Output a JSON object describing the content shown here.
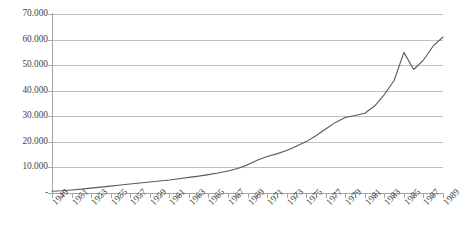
{
  "chart_data": {
    "type": "line",
    "title": "",
    "subtitle": "",
    "xlabel": "",
    "ylabel": "",
    "xlim": [
      1949,
      1989
    ],
    "ylim": [
      0,
      70000
    ],
    "grid": true,
    "legend": false,
    "legend_position": "none",
    "y_tick_labels": [
      "70.000",
      "60.000",
      "50.000",
      "40.000",
      "30.000",
      "20.000",
      "10.000",
      "-"
    ],
    "y_tick_values": [
      70000,
      60000,
      50000,
      40000,
      30000,
      20000,
      10000,
      0
    ],
    "x_tick_labels": [
      "1949",
      "1951",
      "1953",
      "1955",
      "1957",
      "1959",
      "1961",
      "1963",
      "1965",
      "1967",
      "1969",
      "1971",
      "1973",
      "1975",
      "1977",
      "1979",
      "1981",
      "1983",
      "1985",
      "1987",
      "1989"
    ],
    "x_tick_values": [
      1949,
      1951,
      1953,
      1955,
      1957,
      1959,
      1961,
      1963,
      1965,
      1967,
      1969,
      1971,
      1973,
      1975,
      1977,
      1979,
      1981,
      1983,
      1985,
      1987,
      1989
    ],
    "x": [
      1949,
      1950,
      1951,
      1952,
      1953,
      1954,
      1955,
      1956,
      1957,
      1958,
      1959,
      1960,
      1961,
      1962,
      1963,
      1964,
      1965,
      1966,
      1967,
      1968,
      1969,
      1970,
      1971,
      1972,
      1973,
      1974,
      1975,
      1976,
      1977,
      1978,
      1979,
      1980,
      1981,
      1982,
      1983,
      1984,
      1985,
      1986,
      1987,
      1988,
      1989
    ],
    "values": [
      700,
      900,
      1200,
      1500,
      1900,
      2300,
      2700,
      3100,
      3500,
      3900,
      4300,
      4700,
      5100,
      5600,
      6100,
      6600,
      7200,
      7800,
      8600,
      9600,
      11000,
      12800,
      14300,
      15300,
      16600,
      18300,
      20100,
      22400,
      25000,
      27600,
      29500,
      30300,
      31200,
      34000,
      38500,
      44000,
      55000,
      48300,
      52000,
      57500,
      61000
    ],
    "series": [
      {
        "name": "series-1",
        "color": "#595959",
        "values": [
          700,
          900,
          1200,
          1500,
          1900,
          2300,
          2700,
          3100,
          3500,
          3900,
          4300,
          4700,
          5100,
          5600,
          6100,
          6600,
          7200,
          7800,
          8600,
          9600,
          11000,
          12800,
          14300,
          15300,
          16600,
          18300,
          20100,
          22400,
          25000,
          27600,
          29500,
          30300,
          31200,
          34000,
          38500,
          44000,
          55000,
          48300,
          52000,
          57500,
          61000
        ]
      }
    ],
    "colors": {
      "line": "#595959",
      "gridline": "#bfbfbf",
      "axis": "#a6a6a6",
      "text": "#3f3f3f",
      "background": "#ffffff"
    }
  }
}
